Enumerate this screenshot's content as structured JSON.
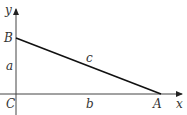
{
  "diagram": {
    "type": "right-triangle-on-axes",
    "axes": {
      "x_label": "x",
      "y_label": "y"
    },
    "vertices": {
      "origin": "C",
      "on_y_axis": "B",
      "on_x_axis": "A"
    },
    "sides": {
      "vertical": "a",
      "horizontal": "b",
      "hypotenuse": "c"
    },
    "colors": {
      "stroke": "#111111",
      "text": "#333333",
      "axis": "#444444"
    }
  }
}
